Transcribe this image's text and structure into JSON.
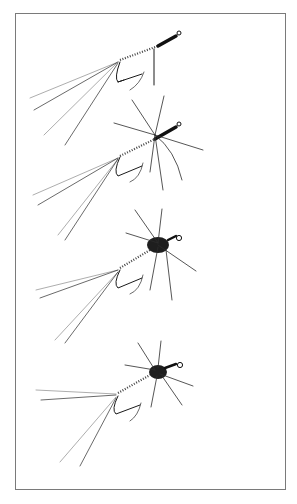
{
  "illustration": {
    "subject": "fly tying sequence",
    "stages": [
      {
        "index": 1,
        "description": "tail and abdomen tied on hook, thread wraps at head"
      },
      {
        "index": 2,
        "description": "hackle legs added at thorax"
      },
      {
        "index": 3,
        "description": "dubbed thorax with legs"
      },
      {
        "index": 4,
        "description": "finished nymph fly"
      }
    ],
    "colors": {
      "ink": "#1a1a1a",
      "frame": "#7a7a7a",
      "background": "#ffffff"
    }
  }
}
